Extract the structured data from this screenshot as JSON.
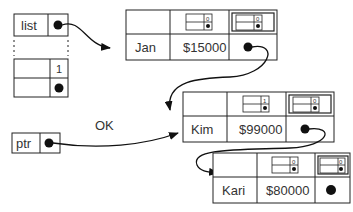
{
  "variables": {
    "list": {
      "label": "list"
    },
    "ptr": {
      "label": "ptr"
    },
    "extra_cell": {
      "value": "1"
    }
  },
  "edge_label": "OK",
  "nodes": [
    {
      "name": "Jan",
      "salary": "$15000",
      "flag_left": "0",
      "flag_right": "0"
    },
    {
      "name": "Kim",
      "salary": "$99000",
      "flag_left": "1",
      "flag_right": "0"
    },
    {
      "name": "Kari",
      "salary": "$80000",
      "flag_left": "0",
      "flag_right": "0"
    }
  ]
}
